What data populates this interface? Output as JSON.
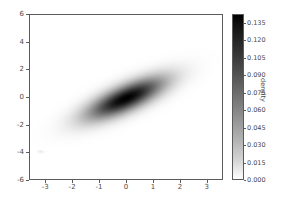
{
  "chart_data": {
    "type": "heatmap",
    "title": "",
    "xlabel": "",
    "ylabel": "",
    "colorbar_label": "density",
    "xlim": [
      -3.6,
      3.6
    ],
    "ylim": [
      -6,
      6
    ],
    "xticks": [
      "-3",
      "-2",
      "-1",
      "0",
      "1",
      "2",
      "3"
    ],
    "xtick_values": [
      -3,
      -2,
      -1,
      0,
      1,
      2,
      3
    ],
    "yticks": [
      "6",
      "4",
      "2",
      "0",
      "-2",
      "-4",
      "-6"
    ],
    "ytick_values": [
      6,
      4,
      2,
      0,
      -2,
      -4,
      -6
    ],
    "colorbar_ticks": [
      "0.000",
      "0.015",
      "0.030",
      "0.045",
      "0.060",
      "0.075",
      "0.090",
      "0.105",
      "0.120",
      "0.135"
    ],
    "colorbar_tick_values": [
      0.0,
      0.015,
      0.03,
      0.045,
      0.06,
      0.075,
      0.09,
      0.105,
      0.12,
      0.135
    ],
    "colorbar_range": [
      0.0,
      0.1425
    ],
    "colormap": "gray_reversed",
    "grid": false,
    "legend": false,
    "distribution": {
      "kind": "bivariate_gaussian_kde",
      "mean_x": 0.0,
      "mean_y": -0.1,
      "sigma_x": 1.0,
      "sigma_y": 1.05,
      "correlation": 0.75,
      "peak_density": 0.1425,
      "tilt_degrees": 37
    },
    "artifacts": [
      {
        "x": -3.2,
        "y": -4.0,
        "intensity": 0.012
      }
    ]
  },
  "colors": {
    "frame": "#5b5b5b",
    "text": "#4a4a4a",
    "background": "#ffffff",
    "density_high": "#000000",
    "density_low": "#ffffff"
  }
}
